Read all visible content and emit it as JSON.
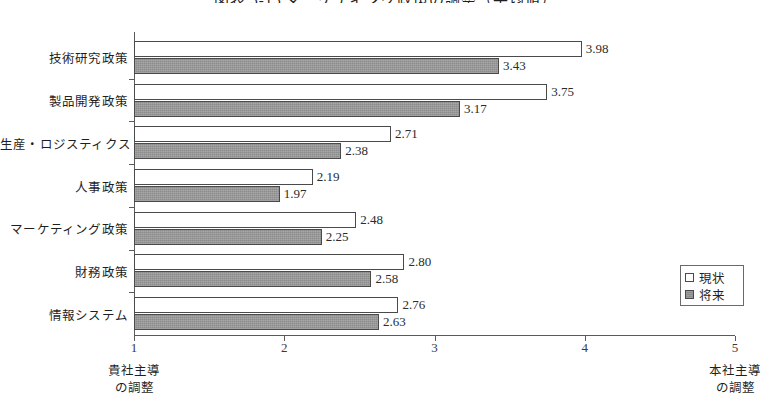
{
  "chart": {
    "title": "図表 5-15  マーケティング政策の調整（平均値）",
    "type": "bar-horizontal-grouped"
  },
  "axis": {
    "x_ticks": [
      "1",
      "2",
      "3",
      "4",
      "5"
    ],
    "x_min": 1,
    "x_max": 5,
    "left_caption_line1": "貴社主導",
    "left_caption_line2": "の調整",
    "right_caption_line1": "本社主導",
    "right_caption_line2": "の調整"
  },
  "legend": {
    "items": [
      {
        "label": "現状",
        "swatch": "white-square-icon"
      },
      {
        "label": "将来",
        "swatch": "gray-square-icon"
      }
    ]
  },
  "chart_data": {
    "type": "bar",
    "orientation": "horizontal",
    "title": "図表 5-15  マーケティング政策の調整（平均値）",
    "xlabel": "",
    "ylabel": "",
    "xlim": [
      1,
      5
    ],
    "xticks": [
      1,
      2,
      3,
      4,
      5
    ],
    "grid": false,
    "legend_position": "right-middle",
    "categories": [
      "技術研究政策",
      "製品開発政策",
      "生産・ロジスティクス",
      "人事政策",
      "マーケティング政策",
      "財務政策",
      "情報システム"
    ],
    "series": [
      {
        "name": "現状",
        "color": "#ffffff",
        "values": [
          3.98,
          3.75,
          2.71,
          2.19,
          2.48,
          2.8,
          2.76
        ]
      },
      {
        "name": "将来",
        "color": "#8c8c8c",
        "values": [
          3.43,
          3.17,
          2.38,
          1.97,
          2.25,
          2.58,
          2.63
        ]
      }
    ],
    "annotations": {
      "left_axis_note": "貴社主導の調整",
      "right_axis_note": "本社主導の調整"
    }
  }
}
